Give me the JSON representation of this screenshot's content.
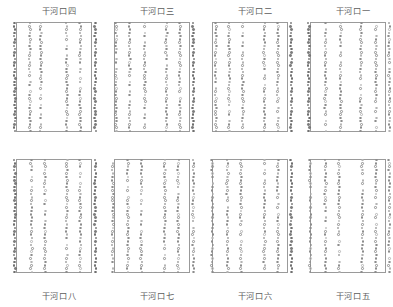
{
  "figure": {
    "type": "scatter-panel-grid",
    "rows": 2,
    "columns": 4,
    "marker_style": "open-circle",
    "frame_color": "#9a9a9a",
    "marker_color": "#8d8d8d",
    "background": "#ffffff"
  },
  "panels": [
    {
      "id": "panel-1",
      "title": "干河口四",
      "title_position": "above",
      "row": 0,
      "column": 0
    },
    {
      "id": "panel-2",
      "title": "干河口三",
      "title_position": "above",
      "row": 0,
      "column": 1
    },
    {
      "id": "panel-3",
      "title": "干河口二",
      "title_position": "above",
      "row": 0,
      "column": 2
    },
    {
      "id": "panel-4",
      "title": "干河口一",
      "title_position": "above",
      "row": 0,
      "column": 3
    },
    {
      "id": "panel-5",
      "title": "干河口八",
      "title_position": "below",
      "row": 1,
      "column": 0
    },
    {
      "id": "panel-6",
      "title": "干河口七",
      "title_position": "below",
      "row": 1,
      "column": 1
    },
    {
      "id": "panel-7",
      "title": "干河口六",
      "title_position": "below",
      "row": 1,
      "column": 2
    },
    {
      "id": "panel-8",
      "title": "干河口五",
      "title_position": "below",
      "row": 1,
      "column": 3
    }
  ],
  "chart_data": {
    "type": "scatter",
    "title": "",
    "xlabel": "",
    "ylabel": "",
    "grid": false,
    "legend": "none",
    "panel_titles": [
      "干河口四",
      "干河口三",
      "干河口二",
      "干河口一",
      "干河口八",
      "干河口七",
      "干河口六",
      "干河口五"
    ],
    "series_per_panel": 6,
    "points_per_series": 34,
    "xlim": [
      0,
      1
    ],
    "ylim": [
      0,
      1
    ],
    "panels": [
      {
        "name": "干河口四",
        "series": [
          {
            "name": "s1",
            "x": 0.02,
            "density": 1.0,
            "style": "solid"
          },
          {
            "name": "s2",
            "x": 0.2,
            "density": 0.94,
            "style": "open"
          },
          {
            "name": "s3",
            "x": 0.33,
            "density": 0.88,
            "style": "open"
          },
          {
            "name": "s4",
            "x": 0.64,
            "density": 0.94,
            "style": "open"
          },
          {
            "name": "s5",
            "x": 0.8,
            "density": 0.91,
            "style": "open"
          },
          {
            "name": "s6",
            "x": 0.98,
            "density": 1.0,
            "style": "solid"
          }
        ]
      },
      {
        "name": "干河口三",
        "series": [
          {
            "name": "s1",
            "x": 0.06,
            "density": 0.94,
            "style": "open"
          },
          {
            "name": "s2",
            "x": 0.22,
            "density": 0.91,
            "style": "open"
          },
          {
            "name": "s3",
            "x": 0.4,
            "density": 0.88,
            "style": "open"
          },
          {
            "name": "s4",
            "x": 0.66,
            "density": 0.94,
            "style": "open"
          },
          {
            "name": "s5",
            "x": 0.82,
            "density": 0.94,
            "style": "open"
          },
          {
            "name": "s6",
            "x": 0.98,
            "density": 1.0,
            "style": "solid"
          }
        ]
      },
      {
        "name": "干河口二",
        "series": [
          {
            "name": "s1",
            "x": 0.08,
            "density": 0.97,
            "style": "open"
          },
          {
            "name": "s2",
            "x": 0.24,
            "density": 0.94,
            "style": "open"
          },
          {
            "name": "s3",
            "x": 0.4,
            "density": 0.91,
            "style": "open"
          },
          {
            "name": "s4",
            "x": 0.66,
            "density": 0.94,
            "style": "open"
          },
          {
            "name": "s5",
            "x": 0.82,
            "density": 0.94,
            "style": "open"
          },
          {
            "name": "s6",
            "x": 0.98,
            "density": 1.0,
            "style": "solid"
          }
        ]
      },
      {
        "name": "干河口一",
        "series": [
          {
            "name": "s1",
            "x": 0.02,
            "density": 1.0,
            "style": "solid"
          },
          {
            "name": "s2",
            "x": 0.22,
            "density": 0.94,
            "style": "open"
          },
          {
            "name": "s3",
            "x": 0.4,
            "density": 0.91,
            "style": "open"
          },
          {
            "name": "s4",
            "x": 0.64,
            "density": 0.94,
            "style": "open"
          },
          {
            "name": "s5",
            "x": 0.82,
            "density": 0.88,
            "style": "open"
          },
          {
            "name": "s6",
            "x": 0.98,
            "density": 0.97,
            "style": "open"
          }
        ]
      },
      {
        "name": "干河口八",
        "series": [
          {
            "name": "s1",
            "x": 0.02,
            "density": 1.0,
            "style": "solid"
          },
          {
            "name": "s2",
            "x": 0.22,
            "density": 0.94,
            "style": "open"
          },
          {
            "name": "s3",
            "x": 0.38,
            "density": 0.91,
            "style": "open"
          },
          {
            "name": "s4",
            "x": 0.64,
            "density": 0.94,
            "style": "open"
          },
          {
            "name": "s5",
            "x": 0.8,
            "density": 0.94,
            "style": "open"
          },
          {
            "name": "s6",
            "x": 0.98,
            "density": 1.0,
            "style": "solid"
          }
        ]
      },
      {
        "name": "干河口七",
        "series": [
          {
            "name": "s1",
            "x": 0.02,
            "density": 0.97,
            "style": "open"
          },
          {
            "name": "s2",
            "x": 0.2,
            "density": 0.94,
            "style": "open"
          },
          {
            "name": "s3",
            "x": 0.36,
            "density": 0.88,
            "style": "open"
          },
          {
            "name": "s4",
            "x": 0.64,
            "density": 0.94,
            "style": "open"
          },
          {
            "name": "s5",
            "x": 0.8,
            "density": 0.94,
            "style": "open"
          },
          {
            "name": "s6",
            "x": 0.98,
            "density": 0.97,
            "style": "open"
          }
        ]
      },
      {
        "name": "干河口六",
        "series": [
          {
            "name": "s1",
            "x": 0.04,
            "density": 0.97,
            "style": "open"
          },
          {
            "name": "s2",
            "x": 0.22,
            "density": 0.94,
            "style": "open"
          },
          {
            "name": "s3",
            "x": 0.38,
            "density": 0.91,
            "style": "open"
          },
          {
            "name": "s4",
            "x": 0.66,
            "density": 0.94,
            "style": "open"
          },
          {
            "name": "s5",
            "x": 0.82,
            "density": 0.94,
            "style": "open"
          },
          {
            "name": "s6",
            "x": 0.98,
            "density": 1.0,
            "style": "solid"
          }
        ]
      },
      {
        "name": "干河口五",
        "series": [
          {
            "name": "s1",
            "x": 0.04,
            "density": 0.97,
            "style": "open"
          },
          {
            "name": "s2",
            "x": 0.22,
            "density": 0.94,
            "style": "open"
          },
          {
            "name": "s3",
            "x": 0.38,
            "density": 0.91,
            "style": "open"
          },
          {
            "name": "s4",
            "x": 0.66,
            "density": 0.94,
            "style": "open"
          },
          {
            "name": "s5",
            "x": 0.82,
            "density": 0.91,
            "style": "open"
          },
          {
            "name": "s6",
            "x": 0.98,
            "density": 0.97,
            "style": "open"
          }
        ]
      }
    ]
  }
}
